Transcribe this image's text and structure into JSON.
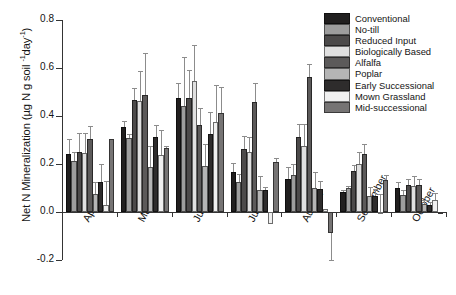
{
  "chart_data": {
    "type": "bar",
    "title": "",
    "xlabel": "",
    "ylabel": "Net N Mineralization (µg N g soil ⁻¹day⁻¹)",
    "ylabel_main": "Net N Mineralization (µg N g soil ",
    "ylabel_sup1": "-1",
    "ylabel_mid": "day",
    "ylabel_sup2": "-1",
    "ylabel_end": ")",
    "ylim": [
      -0.2,
      0.8
    ],
    "ytick_labels": [
      "0.8",
      "0.6",
      "0.4",
      "0.2",
      "0.0",
      "-0.2"
    ],
    "ytick_values": [
      0.8,
      0.6,
      0.4,
      0.2,
      0.0,
      -0.2
    ],
    "grid": false,
    "legend_position": "top-right",
    "categories": [
      "April",
      "May",
      "June",
      "July",
      "August",
      "September",
      "October"
    ],
    "series": [
      {
        "name": "Conventional",
        "color": "#211f1f",
        "values": [
          0.24,
          0.356,
          0.477,
          0.165,
          0.139,
          0.083,
          0.101
        ],
        "errors": [
          0.065,
          0.022,
          0.06,
          0.038,
          0.049,
          0.009,
          0.023
        ]
      },
      {
        "name": "No-till",
        "color": "#9d9d9d",
        "values": [
          0.214,
          0.307,
          0.443,
          0.127,
          0.154,
          0.098,
          0.072
        ],
        "errors": [
          0.038,
          0.017,
          0.202,
          0.03,
          0.048,
          0.011,
          0.02
        ]
      },
      {
        "name": "Reduced Input",
        "color": "#4c4a4a",
        "values": [
          0.252,
          0.468,
          0.473,
          0.264,
          0.312,
          0.17,
          0.112
        ],
        "errors": [
          0.078,
          0.049,
          0.118,
          0.054,
          0.053,
          0.024,
          0.025
        ]
      },
      {
        "name": "Biologically Based",
        "color": "#e0e0e0",
        "values": [
          0.245,
          0.464,
          0.546,
          0.248,
          0.275,
          0.201,
          0.108
        ],
        "errors": [
          0.085,
          0.125,
          0.149,
          0.063,
          0.09,
          0.047,
          0.042
        ]
      },
      {
        "name": "Alfalfa",
        "color": "#5c5a5a",
        "values": [
          0.305,
          0.486,
          0.361,
          0.459,
          0.561,
          0.242,
          0.111
        ],
        "errors": [
          0.053,
          0.175,
          0.071,
          0.08,
          0.054,
          0.043,
          0.028
        ]
      },
      {
        "name": "Poplar",
        "color": "#b5b5b5",
        "values": [
          0.073,
          0.189,
          0.192,
          0.09,
          0.101,
          0.068,
          0.035
        ],
        "errors": [
          0.051,
          0.085,
          0.09,
          0.058,
          0.067,
          0.037,
          0.014
        ]
      },
      {
        "name": "Early Successional",
        "color": "#2e2c2c",
        "values": [
          0.126,
          0.314,
          0.325,
          0.091,
          0.096,
          0.066,
          0.03
        ],
        "errors": [
          0.073,
          0.048,
          0.092,
          0.014,
          0.032,
          0.028,
          0.01
        ]
      },
      {
        "name": "Mown Grassland",
        "color": "#f0f0f0",
        "values": [
          0.031,
          0.237,
          0.373,
          -0.052,
          0.013,
          0.002,
          0.052
        ],
        "errors": [
          0.098,
          0.103,
          0.156,
          0.0,
          0.0,
          0.073,
          0.026
        ]
      },
      {
        "name": "Mid-successional",
        "color": "#767474",
        "values": [
          0.305,
          0.265,
          0.414,
          0.209,
          -0.089,
          0.135,
          0.002
        ],
        "errors": [
          0.0,
          0.012,
          0.105,
          0.016,
          0.11,
          0.02,
          0.0
        ]
      }
    ]
  },
  "legend": {
    "entries": [
      "Conventional",
      "No-till",
      "Reduced Input",
      "Biologically Based",
      "Alfalfa",
      "Poplar",
      "Early Successional",
      "Mown Grassland",
      "Mid-successional"
    ]
  }
}
